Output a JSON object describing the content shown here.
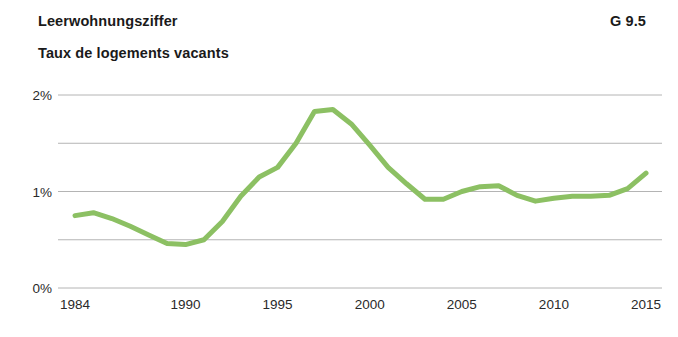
{
  "header": {
    "title_de": "Leerwohnungsziffer",
    "title_fr": "Taux de logements vacants",
    "figure_number": "G 9.5"
  },
  "chart_data": {
    "type": "line",
    "subtitle": "Taux de logements vacants",
    "xlabel": "",
    "ylabel": "",
    "xlim": [
      1984,
      2015
    ],
    "ylim": [
      0,
      2.05
    ],
    "grid": true,
    "grid_values": [
      0,
      0.5,
      1,
      1.5,
      2
    ],
    "legend": "none",
    "line_color": "#8CC063",
    "line_width": 5,
    "gridline_color": "#b4b4b4",
    "x_tick_labels": [
      "1984",
      "1990",
      "1995",
      "2000",
      "2005",
      "2010",
      "2015"
    ],
    "x_ticks": [
      1984,
      1990,
      1995,
      2000,
      2005,
      2010,
      2015
    ],
    "y_tick_labels": [
      "0%",
      "1%",
      "2%"
    ],
    "y_ticks": [
      0,
      1,
      2
    ],
    "unit": "%",
    "x": [
      1984,
      1985,
      1986,
      1987,
      1988,
      1989,
      1990,
      1991,
      1992,
      1993,
      1994,
      1995,
      1996,
      1997,
      1998,
      1999,
      2000,
      2001,
      2002,
      2003,
      2004,
      2005,
      2006,
      2007,
      2008,
      2009,
      2010,
      2011,
      2012,
      2013,
      2014,
      2015
    ],
    "values": [
      0.75,
      0.78,
      0.72,
      0.64,
      0.55,
      0.46,
      0.45,
      0.5,
      0.69,
      0.95,
      1.15,
      1.25,
      1.5,
      1.83,
      1.85,
      1.7,
      1.48,
      1.25,
      1.08,
      0.92,
      0.92,
      1.0,
      1.05,
      1.06,
      0.96,
      0.9,
      0.93,
      0.95,
      0.95,
      0.96,
      1.03,
      1.19
    ]
  }
}
